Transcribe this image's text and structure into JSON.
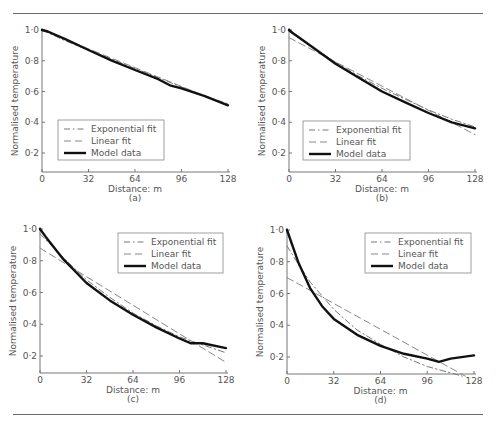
{
  "figure": {
    "panel_count": 4
  },
  "chart_data": [
    {
      "type": "line",
      "panel_label": "(a)",
      "xlabel": "Distance: m",
      "ylabel": "Normalised temperature",
      "xlim": [
        0,
        128
      ],
      "ylim": [
        0.08,
        1.0
      ],
      "xticks": [
        0,
        32,
        64,
        96,
        128
      ],
      "xtick_labels": [
        "0",
        "32",
        "64",
        "96",
        "128"
      ],
      "yticks": [
        0.2,
        0.4,
        0.6,
        0.8,
        1.0
      ],
      "ytick_labels": [
        "0·2",
        "0·4",
        "0·6",
        "0·8",
        "1·0"
      ],
      "grid": false,
      "legend_position": "lower-left",
      "legend": [
        "Exponential fit",
        "Linear fit",
        "Model data"
      ],
      "series": [
        {
          "name": "Exponential fit",
          "style": "dash-dot",
          "x": [
            0,
            16,
            32,
            48,
            64,
            80,
            96,
            112,
            128
          ],
          "y": [
            1.0,
            0.93,
            0.87,
            0.81,
            0.75,
            0.69,
            0.63,
            0.57,
            0.52
          ]
        },
        {
          "name": "Linear fit",
          "style": "dashed",
          "x": [
            0,
            128
          ],
          "y": [
            1.0,
            0.51
          ]
        },
        {
          "name": "Model data",
          "style": "solid",
          "x": [
            0,
            4,
            16,
            32,
            48,
            64,
            80,
            88,
            96,
            112,
            128
          ],
          "y": [
            1.0,
            0.99,
            0.94,
            0.87,
            0.8,
            0.74,
            0.68,
            0.64,
            0.62,
            0.57,
            0.51
          ]
        }
      ]
    },
    {
      "type": "line",
      "panel_label": "(b)",
      "xlabel": "Distance: m",
      "ylabel": "Normalised temperature",
      "xlim": [
        0,
        128
      ],
      "ylim": [
        0.08,
        1.0
      ],
      "xticks": [
        0,
        32,
        64,
        96,
        128
      ],
      "xtick_labels": [
        "0",
        "32",
        "64",
        "96",
        "128"
      ],
      "yticks": [
        0.2,
        0.4,
        0.6,
        0.8,
        1.0
      ],
      "ytick_labels": [
        "0·2",
        "0·4",
        "0·6",
        "0·8",
        "1·0"
      ],
      "grid": false,
      "legend_position": "lower-left",
      "legend": [
        "Exponential fit",
        "Linear fit",
        "Model data"
      ],
      "series": [
        {
          "name": "Exponential fit",
          "style": "dash-dot",
          "x": [
            0,
            16,
            32,
            48,
            64,
            80,
            96,
            112,
            128
          ],
          "y": [
            0.99,
            0.89,
            0.79,
            0.7,
            0.62,
            0.55,
            0.48,
            0.42,
            0.37
          ]
        },
        {
          "name": "Linear fit",
          "style": "dashed",
          "x": [
            0,
            128
          ],
          "y": [
            0.95,
            0.32
          ]
        },
        {
          "name": "Model data",
          "style": "solid",
          "x": [
            0,
            4,
            16,
            32,
            48,
            64,
            80,
            96,
            112,
            128
          ],
          "y": [
            1.0,
            0.97,
            0.89,
            0.78,
            0.69,
            0.6,
            0.53,
            0.46,
            0.4,
            0.36
          ]
        }
      ]
    },
    {
      "type": "line",
      "panel_label": "(c)",
      "xlabel": "Distance: m",
      "ylabel": "Normalised temperature",
      "xlim": [
        0,
        128
      ],
      "ylim": [
        0.08,
        1.0
      ],
      "xticks": [
        0,
        32,
        64,
        96,
        128
      ],
      "xtick_labels": [
        "0",
        "32",
        "64",
        "96",
        "128"
      ],
      "yticks": [
        0.2,
        0.4,
        0.6,
        0.8,
        1.0
      ],
      "ytick_labels": [
        "0·2",
        "0·4",
        "0·6",
        "0·8",
        "1·0"
      ],
      "grid": false,
      "legend_position": "top-right",
      "legend": [
        "Exponential fit",
        "Linear fit",
        "Model data"
      ],
      "series": [
        {
          "name": "Exponential fit",
          "style": "dash-dot",
          "x": [
            0,
            16,
            32,
            48,
            64,
            80,
            96,
            112,
            128
          ],
          "y": [
            0.97,
            0.82,
            0.68,
            0.57,
            0.47,
            0.39,
            0.32,
            0.27,
            0.22
          ]
        },
        {
          "name": "Linear fit",
          "style": "dashed",
          "x": [
            0,
            128
          ],
          "y": [
            0.88,
            0.16
          ]
        },
        {
          "name": "Model data",
          "style": "solid",
          "x": [
            0,
            4,
            16,
            32,
            48,
            64,
            80,
            96,
            104,
            112,
            128
          ],
          "y": [
            1.0,
            0.95,
            0.81,
            0.66,
            0.55,
            0.46,
            0.38,
            0.31,
            0.28,
            0.28,
            0.25
          ]
        }
      ]
    },
    {
      "type": "line",
      "panel_label": "(d)",
      "xlabel": "Distance: m",
      "ylabel": "Normalised temperature",
      "xlim": [
        0,
        128
      ],
      "ylim": [
        0.08,
        1.0
      ],
      "xticks": [
        0,
        32,
        64,
        96,
        128
      ],
      "xtick_labels": [
        "0",
        "32",
        "64",
        "96",
        "128"
      ],
      "yticks": [
        0.2,
        0.4,
        0.6,
        0.8,
        1.0
      ],
      "ytick_labels": [
        "0·2",
        "0·4",
        "0·6",
        "0·8",
        "1·0"
      ],
      "grid": false,
      "legend_position": "top-right",
      "legend": [
        "Exponential fit",
        "Linear fit",
        "Model data"
      ],
      "series": [
        {
          "name": "Exponential fit",
          "style": "dash-dot",
          "x": [
            0,
            8,
            16,
            32,
            48,
            64,
            80,
            96,
            112,
            120
          ],
          "y": [
            0.9,
            0.78,
            0.67,
            0.5,
            0.37,
            0.28,
            0.2,
            0.14,
            0.1,
            0.08
          ]
        },
        {
          "name": "Linear fit",
          "style": "dashed",
          "x": [
            0,
            122
          ],
          "y": [
            0.7,
            0.08
          ]
        },
        {
          "name": "Model data",
          "style": "solid",
          "x": [
            0,
            8,
            16,
            24,
            32,
            48,
            64,
            80,
            96,
            104,
            112,
            128
          ],
          "y": [
            1.0,
            0.79,
            0.63,
            0.52,
            0.44,
            0.34,
            0.27,
            0.22,
            0.19,
            0.17,
            0.19,
            0.21
          ]
        }
      ]
    }
  ]
}
